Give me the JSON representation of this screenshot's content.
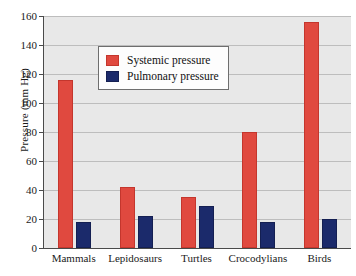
{
  "chart_data": {
    "type": "bar",
    "title": "",
    "xlabel": "",
    "ylabel": "Pressure (mm Hg)",
    "ylim": [
      0,
      160
    ],
    "ytick_step": 20,
    "yticks": [
      0,
      20,
      40,
      60,
      80,
      100,
      120,
      140,
      160
    ],
    "grid": true,
    "legend_position": "upper-center-left",
    "categories": [
      "Mammals",
      "Lepidosaurs",
      "Turtles",
      "Crocodylians",
      "Birds"
    ],
    "series": [
      {
        "name": "Systemic pressure",
        "color": "#e0493f",
        "values": [
          116,
          42,
          35,
          80,
          156
        ]
      },
      {
        "name": "Pulmonary pressure",
        "color": "#1b2a6b",
        "values": [
          18,
          22,
          29,
          18,
          20
        ]
      }
    ]
  },
  "legend": {
    "items": [
      {
        "label": "Systemic pressure"
      },
      {
        "label": "Pulmonary pressure"
      }
    ]
  },
  "axes": {
    "y_title": "Pressure (mm Hg)",
    "y_tick_labels": [
      "0",
      "20",
      "40",
      "60",
      "80",
      "100",
      "120",
      "140",
      "160"
    ],
    "x_tick_labels": [
      "Mammals",
      "Lepidosaurs",
      "Turtles",
      "Crocodylians",
      "Birds"
    ]
  },
  "colors": {
    "systemic": "#e0493f",
    "pulmonary": "#1b2a6b",
    "plot_background": "#e8e8e8",
    "gridline": "#bdbdbd",
    "axis": "#4a4a4a",
    "page_background": "#ffffff"
  }
}
